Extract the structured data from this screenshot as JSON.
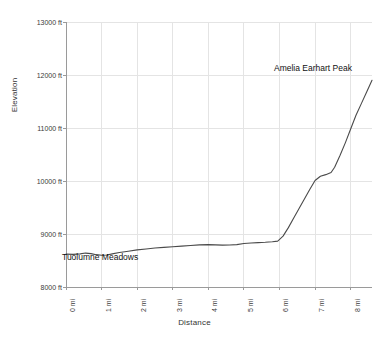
{
  "chart_data": {
    "type": "line",
    "title": "",
    "xlabel": "Distance",
    "ylabel": "Elevation",
    "xlim": [
      0,
      8.6
    ],
    "ylim": [
      8000,
      13000
    ],
    "grid": true,
    "legend": null,
    "x_tick_labels": [
      "0 mi",
      "1 mi",
      "2 mi",
      "3 mi",
      "4 mi",
      "5 mi",
      "6 mi",
      "7 mi",
      "8 mi"
    ],
    "x_tick_values": [
      0,
      1,
      2,
      3,
      4,
      5,
      6,
      7,
      8
    ],
    "y_tick_labels": [
      "8000 ft",
      "9000 ft",
      "10000 ft",
      "11000 ft",
      "12000 ft",
      "13000 ft"
    ],
    "y_tick_values": [
      8000,
      9000,
      10000,
      11000,
      12000,
      13000
    ],
    "line_color": "#4a4a4a",
    "grid_color": "#e4e4e4",
    "series": [
      {
        "name": "Elevation profile",
        "x": [
          0.0,
          0.2,
          0.4,
          0.55,
          0.7,
          0.85,
          1.0,
          1.15,
          1.3,
          1.5,
          1.75,
          2.0,
          2.25,
          2.5,
          2.75,
          3.0,
          3.25,
          3.5,
          3.75,
          4.0,
          4.2,
          4.4,
          4.6,
          4.8,
          5.0,
          5.2,
          5.4,
          5.6,
          5.8,
          5.95,
          6.1,
          6.25,
          6.4,
          6.55,
          6.7,
          6.85,
          7.0,
          7.15,
          7.3,
          7.45,
          7.55,
          7.7,
          7.85,
          8.0,
          8.15,
          8.3,
          8.45,
          8.6
        ],
        "y": [
          8620,
          8615,
          8625,
          8640,
          8630,
          8610,
          8600,
          8605,
          8625,
          8650,
          8675,
          8700,
          8718,
          8735,
          8748,
          8760,
          8772,
          8782,
          8795,
          8800,
          8795,
          8790,
          8792,
          8800,
          8820,
          8830,
          8838,
          8845,
          8855,
          8865,
          8960,
          9120,
          9300,
          9480,
          9660,
          9840,
          10010,
          10090,
          10120,
          10160,
          10260,
          10480,
          10720,
          10980,
          11240,
          11460,
          11680,
          11900
        ]
      }
    ],
    "annotations": [
      {
        "text": "Tuolumne Meadows",
        "x": 0.15,
        "y": 8400
      },
      {
        "text": "Amelia Earhart Peak",
        "x": 6.55,
        "y": 12450
      }
    ]
  }
}
